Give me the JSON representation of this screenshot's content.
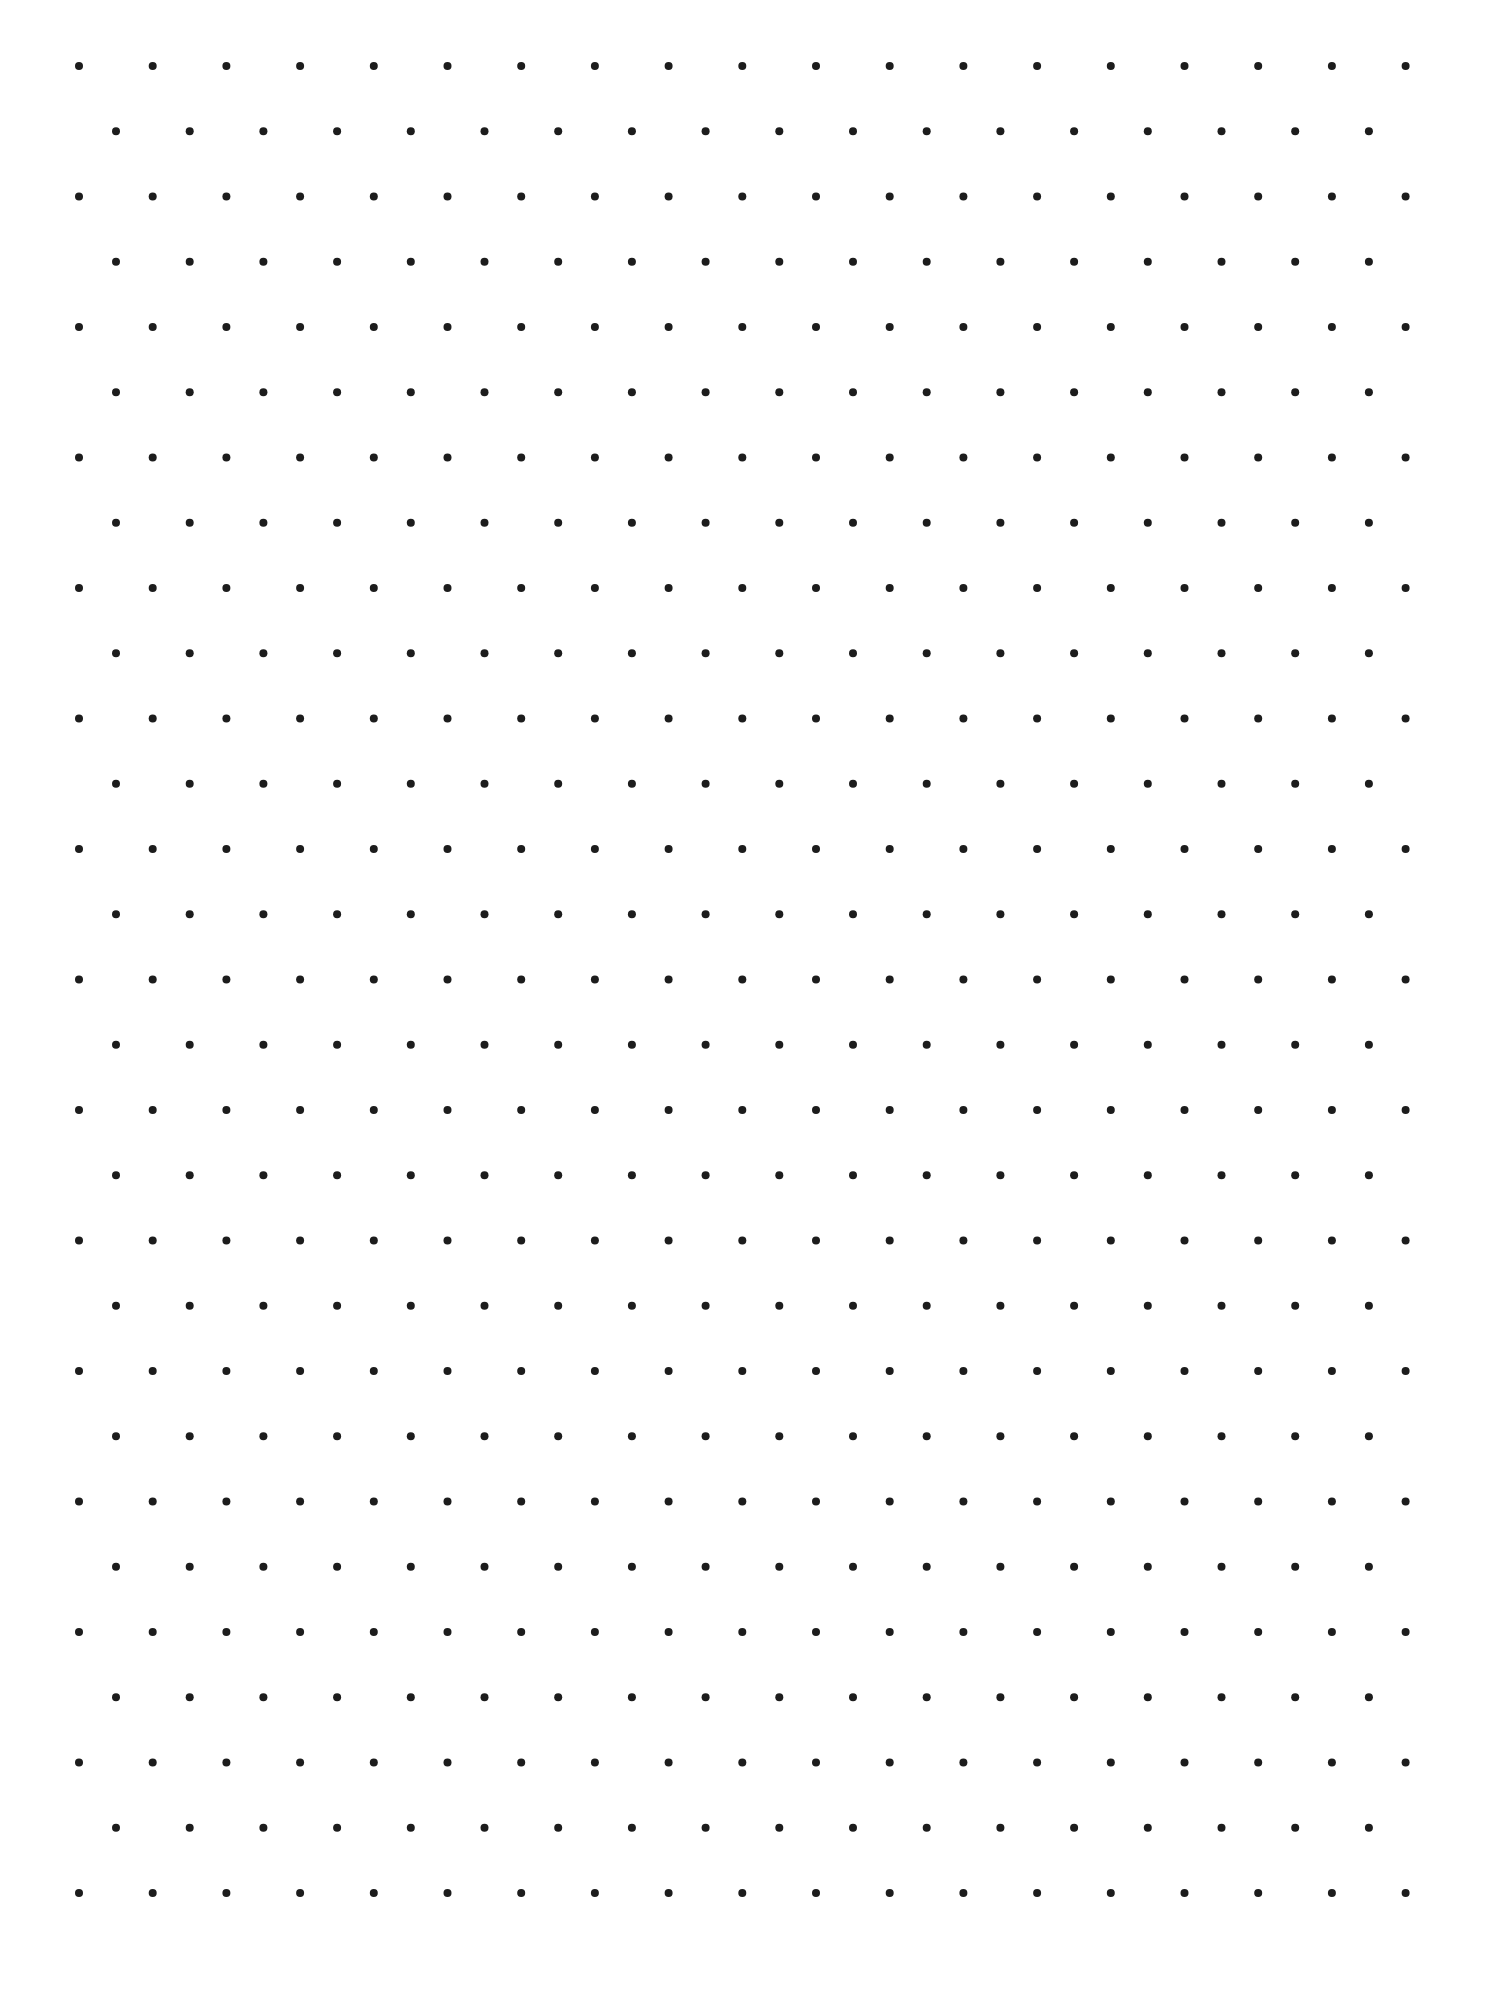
{
  "sheet": {
    "type": "isometric-dot-grid",
    "width": 1486,
    "height": 1996,
    "background_color": "#ffffff"
  },
  "grid": {
    "dot_color": "#1c1c1c",
    "dot_radius": 4,
    "row_count": 29,
    "first_row_y": 66,
    "row_spacing": 65.25,
    "even_rows": {
      "first_x": 79,
      "count": 19,
      "spacing": 73.7
    },
    "odd_rows": {
      "first_x": 116,
      "count": 18,
      "spacing": 73.7
    }
  }
}
